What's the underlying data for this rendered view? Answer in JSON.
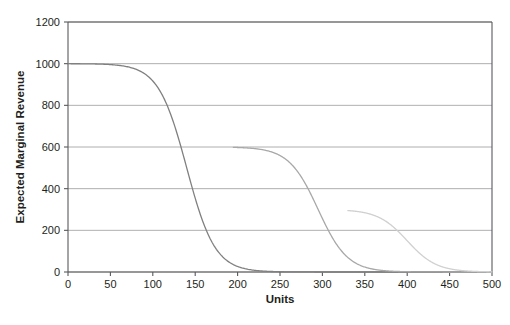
{
  "chart_data": {
    "type": "line",
    "title": "",
    "xlabel": "Units",
    "ylabel": "Expected Marginal Revenue",
    "xlim": [
      0,
      500
    ],
    "ylim": [
      0,
      1200
    ],
    "xticks": [
      0,
      50,
      100,
      150,
      200,
      250,
      300,
      350,
      400,
      450,
      500
    ],
    "yticks": [
      0,
      200,
      400,
      600,
      800,
      1000,
      1200
    ],
    "grid": true,
    "legend": "none",
    "series": [
      {
        "name": "tier-1",
        "color": "#808080",
        "plateau": 1000,
        "midpoint": 140,
        "steepness": 0.06,
        "x_start": 0,
        "x_end": 500
      },
      {
        "name": "tier-2",
        "color": "#a8a8a8",
        "plateau": 600,
        "midpoint": 295,
        "steepness": 0.058,
        "x_start": 195,
        "x_end": 500
      },
      {
        "name": "tier-3",
        "color": "#d0d0d0",
        "plateau": 300,
        "midpoint": 400,
        "steepness": 0.058,
        "x_start": 330,
        "x_end": 500
      }
    ]
  },
  "axes": {
    "y_title": "Expected Marginal Revenue",
    "x_title": "Units",
    "x_tick_labels": [
      "0",
      "50",
      "100",
      "150",
      "200",
      "250",
      "300",
      "350",
      "400",
      "450",
      "500"
    ],
    "y_tick_labels": [
      "0",
      "200",
      "400",
      "600",
      "800",
      "1000",
      "1200"
    ]
  },
  "colors": {
    "axis": "#58595b",
    "grid": "#9a9a9a",
    "text": "#231f20",
    "background": "#ffffff"
  },
  "caption": {
    "text": ""
  }
}
